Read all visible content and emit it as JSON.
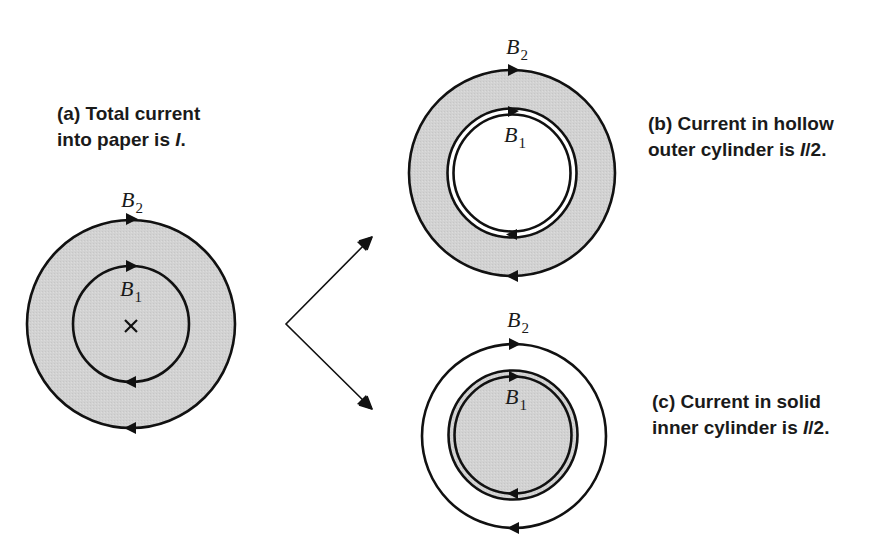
{
  "colors": {
    "fill_gray": "#d4d4d4",
    "stroke": "#111111",
    "background": "#ffffff"
  },
  "panel_a": {
    "caption_line1": "(a) Total current",
    "caption_line2_prefix": "into paper is ",
    "caption_line2_var": "I",
    "caption_line2_suffix": ".",
    "label_outer": "B",
    "label_outer_sub": "2",
    "label_inner": "B",
    "label_inner_sub": "1",
    "center_mark": "×"
  },
  "panel_b": {
    "caption_line1": "(b) Current in hollow",
    "caption_line2_prefix": "outer cylinder is ",
    "caption_line2_var": "I",
    "caption_line2_suffix": "/2.",
    "label_outer": "B",
    "label_outer_sub": "2",
    "label_inner": "B",
    "label_inner_sub": "1"
  },
  "panel_c": {
    "caption_line1": "(c) Current in solid",
    "caption_line2_prefix": "inner cylinder is ",
    "caption_line2_var": "I",
    "caption_line2_suffix": "/2.",
    "label_outer": "B",
    "label_outer_sub": "2",
    "label_inner": "B",
    "label_inner_sub": "1"
  }
}
